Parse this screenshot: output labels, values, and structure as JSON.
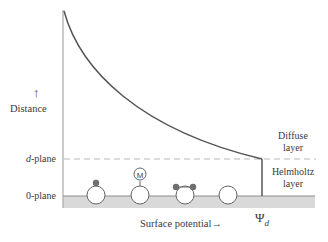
{
  "diagram": {
    "axis_labels": {
      "y_arrow": "↑",
      "y_label": "Distance",
      "x_label": "Surface potential",
      "x_arrow": "→"
    },
    "planes": {
      "d_plane_prefix": "d",
      "d_plane_suffix": "-plane",
      "zero_plane": "0-plane"
    },
    "layers": {
      "diffuse_line1": "Diffuse",
      "diffuse_line2": "layer",
      "helmholtz_line1": "Helmholtz",
      "helmholtz_line2": "layer"
    },
    "potential_symbol": "Ψ",
    "potential_subscript": "d",
    "adsorbed_species": [
      {
        "type": "single-dot",
        "label": ""
      },
      {
        "type": "metal-complex",
        "label": "M"
      },
      {
        "type": "double-dot",
        "label": ""
      },
      {
        "type": "empty-site",
        "label": ""
      }
    ],
    "colors": {
      "line": "#555555",
      "axis": "#9a9a9a",
      "dashed": "#b5b5b5",
      "surface": "#d8d8d8",
      "dot": "#6e6e6e"
    }
  }
}
